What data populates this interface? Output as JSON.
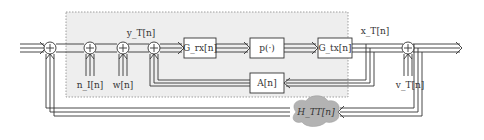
{
  "diagram": {
    "type": "block-diagram",
    "region_fill": "#eeeeee",
    "region_border": "#888888",
    "line_color": "#333333",
    "cloud_fill": "#b3b3b3",
    "signals": {
      "y_label": "y_T[n]",
      "x_label": "x_T[n]",
      "n_label": "n_I[n]",
      "w_label": "w[n]",
      "v_label": "v_T[n]"
    },
    "blocks": {
      "grx": {
        "label": "G_rx[n]"
      },
      "p": {
        "label": "p(·)"
      },
      "gtx": {
        "label": "G_tx[n]"
      },
      "a": {
        "label": "A[n]"
      },
      "htt": {
        "label": "H_TT[n]"
      }
    },
    "summing_junction_symbol": "+"
  }
}
